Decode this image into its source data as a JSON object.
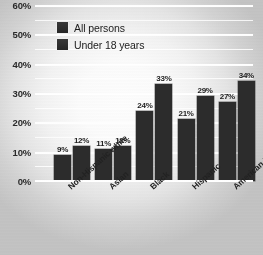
{
  "chart_data": {
    "type": "bar",
    "title": "",
    "xlabel": "",
    "ylabel": "",
    "categories": [
      "Non-Hispanic white",
      "Asian",
      "Black",
      "Hispanic",
      "American Indian"
    ],
    "series": [
      {
        "name": "All persons",
        "values": [
          9,
          11,
          24,
          21,
          27
        ],
        "labels": [
          "9%",
          "11%",
          "24%",
          "21%",
          "27%"
        ],
        "color": "#2c2c2c"
      },
      {
        "name": "Under 18 years",
        "values": [
          12,
          12,
          33,
          29,
          34
        ],
        "labels": [
          "12%",
          "12%",
          "33%",
          "29%",
          "34%"
        ],
        "color": "#2c2c2c"
      }
    ],
    "ylim": [
      0,
      60
    ],
    "ytick_values": [
      0,
      10,
      20,
      30,
      40,
      50,
      60
    ],
    "ytick_labels": [
      "0%",
      "10%",
      "20%",
      "30%",
      "40%",
      "50%",
      "60%"
    ],
    "yminor_values": [
      5,
      15,
      25,
      35,
      45,
      55
    ],
    "grid": true,
    "grid_color": "#ffffff",
    "legend_position": "upper-left",
    "value_labels_shown": true
  },
  "legend": {
    "items": [
      {
        "label": "All persons"
      },
      {
        "label": "Under 18 years"
      }
    ]
  }
}
